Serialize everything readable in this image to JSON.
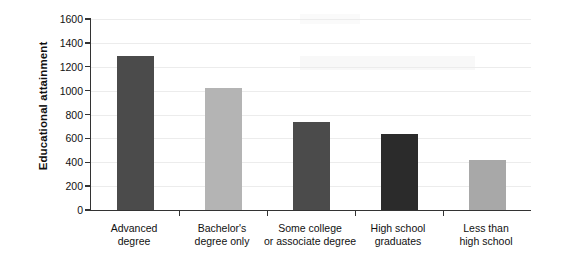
{
  "chart_data": {
    "type": "bar",
    "title": "",
    "xlabel": "",
    "ylabel": "Educational attainment",
    "ylim": [
      0,
      1600
    ],
    "ytick_step": 200,
    "yticks": [
      1600,
      1400,
      1200,
      1000,
      800,
      600,
      400,
      200,
      0
    ],
    "ytick_labels": [
      "1600",
      "1400",
      "1200",
      "1000",
      "800",
      "600",
      "400",
      "200",
      "0"
    ],
    "grid": true,
    "legend": "none",
    "categories": [
      "Advanced\ndegree",
      "Bachelor's\ndegree only",
      "Some college\nor associate degree",
      "High school\ngraduates",
      "Less than\nhigh school"
    ],
    "values": [
      1290,
      1025,
      735,
      635,
      420
    ],
    "bar_colors": [
      "#4b4b4b",
      "#b4b4b4",
      "#4b4b4b",
      "#2b2b2b",
      "#a8a8a8"
    ]
  },
  "axis": {
    "line_color": "#333333",
    "grid_color": "#ececec"
  }
}
